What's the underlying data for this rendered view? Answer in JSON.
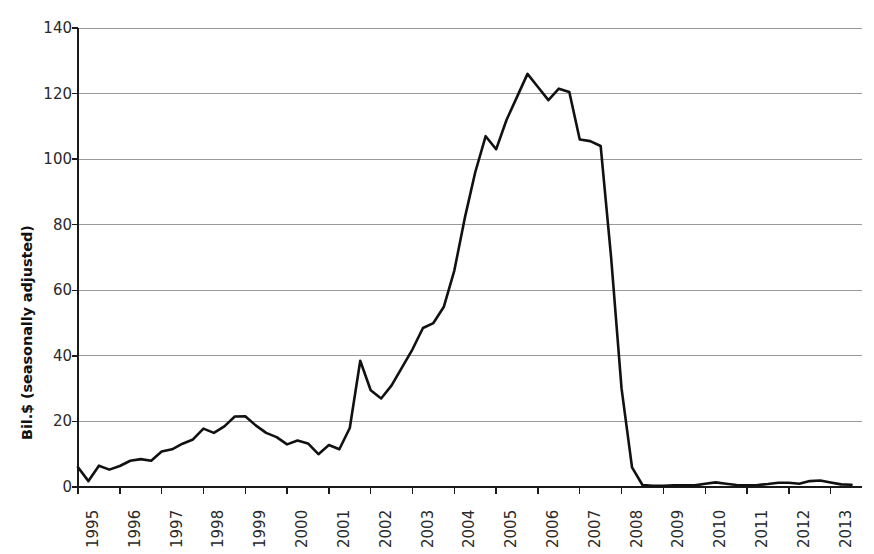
{
  "chart_data": {
    "type": "line",
    "title": "",
    "xlabel": "",
    "ylabel": "Bil.$ (seasonally adjusted)",
    "ylim": [
      0,
      140
    ],
    "xlim": [
      1995,
      2013.75
    ],
    "grid": true,
    "legend": "none",
    "yticks": [
      140,
      120,
      100,
      80,
      60,
      40,
      20,
      0
    ],
    "xticks": [
      "1995",
      "1996",
      "1997",
      "1998",
      "1999",
      "2000",
      "2001",
      "2002",
      "2003",
      "2004",
      "2005",
      "2006",
      "2007",
      "2008",
      "2009",
      "2010",
      "2011",
      "2012",
      "2013"
    ],
    "series": [
      {
        "name": "Asset-backed commercial paper outstanding",
        "color": "#111111",
        "x": [
          1995.0,
          1995.25,
          1995.5,
          1995.75,
          1996.0,
          1996.25,
          1996.5,
          1996.75,
          1997.0,
          1997.25,
          1997.5,
          1997.75,
          1998.0,
          1998.25,
          1998.5,
          1998.75,
          1999.0,
          1999.25,
          1999.5,
          1999.75,
          2000.0,
          2000.25,
          2000.5,
          2000.75,
          2001.0,
          2001.25,
          2001.5,
          2001.75,
          2002.0,
          2002.25,
          2002.5,
          2002.75,
          2003.0,
          2003.25,
          2003.5,
          2003.75,
          2004.0,
          2004.25,
          2004.5,
          2004.75,
          2005.0,
          2005.25,
          2005.5,
          2005.75,
          2006.0,
          2006.25,
          2006.5,
          2006.75,
          2007.0,
          2007.25,
          2007.5,
          2007.75,
          2008.0,
          2008.25,
          2008.5,
          2008.75,
          2009.0,
          2009.25,
          2009.5,
          2009.75,
          2010.0,
          2010.25,
          2010.5,
          2010.75,
          2011.0,
          2011.25,
          2011.5,
          2011.75,
          2012.0,
          2012.25,
          2012.5,
          2012.75,
          2013.0,
          2013.25,
          2013.5
        ],
        "y": [
          6.0,
          1.8,
          6.5,
          5.3,
          6.4,
          8.0,
          8.5,
          8.0,
          10.8,
          11.5,
          13.2,
          14.5,
          17.8,
          16.5,
          18.5,
          21.5,
          21.6,
          18.8,
          16.5,
          15.2,
          13.0,
          14.2,
          13.3,
          10.0,
          12.8,
          11.5,
          18.0,
          38.5,
          29.5,
          27.0,
          31.0,
          36.5,
          42.0,
          48.5,
          50.0,
          55.0,
          66.0,
          82.0,
          96.0,
          107.0,
          103.0,
          112.0,
          119.0,
          126.0,
          122.0,
          118.0,
          121.5,
          120.5,
          106.0,
          105.5,
          104.0,
          70.0,
          30.0,
          6.0,
          0.6,
          0.4,
          0.4,
          0.5,
          0.5,
          0.5,
          1.0,
          1.4,
          1.0,
          0.6,
          0.5,
          0.6,
          0.9,
          1.3,
          1.3,
          1.0,
          1.8,
          2.0,
          1.4,
          0.8,
          0.7
        ]
      }
    ]
  },
  "axis": {
    "ylabel_text": "Bil.$ (seasonally adjusted)"
  }
}
